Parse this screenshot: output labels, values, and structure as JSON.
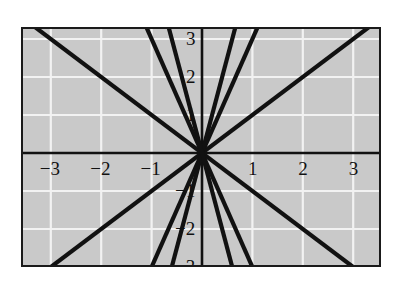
{
  "figure": {
    "title": "",
    "background_color": "#ffffff",
    "plot_background_color": "#c9c9c9",
    "frame_color": "#1a1a1a",
    "gridline_color": "#f2f2f2",
    "axis_color": "#111111",
    "line_color": "#111111"
  },
  "axes": {
    "x_tick_labels": [
      "−3",
      "−2",
      "−1",
      "1",
      "2",
      "3"
    ],
    "x_tick_values": [
      -3,
      -2,
      -1,
      1,
      2,
      3
    ],
    "y_tick_labels": [
      "3",
      "2",
      "1",
      "−1",
      "−2",
      "−3"
    ],
    "y_tick_values": [
      3,
      2,
      1,
      -1,
      -2,
      -3
    ]
  },
  "chart_data": {
    "type": "line",
    "title": "",
    "xlabel": "",
    "ylabel": "",
    "xlim": [
      -3.6,
      3.6
    ],
    "ylim": [
      -3.4,
      3.4
    ],
    "grid": true,
    "legend": "none",
    "x_ticks": [
      -3,
      -2,
      -1,
      1,
      2,
      3
    ],
    "y_ticks": [
      -3,
      -2,
      -1,
      1,
      2,
      3
    ],
    "series": [
      {
        "name": "y = 1x",
        "slope": 1,
        "intercept": 0,
        "x": [
          -3.45,
          3.45
        ],
        "y": [
          -3.45,
          3.45
        ]
      },
      {
        "name": "y = 3x",
        "slope": 3,
        "intercept": 0,
        "x": [
          -1.1,
          1.1
        ],
        "y": [
          -3.3,
          3.3
        ]
      },
      {
        "name": "y = 5x",
        "slope": 5,
        "intercept": 0,
        "x": [
          -0.66,
          0.66
        ],
        "y": [
          -3.3,
          3.3
        ]
      },
      {
        "name": "y = -1x",
        "slope": -1,
        "intercept": 0,
        "x": [
          -3.45,
          3.45
        ],
        "y": [
          3.45,
          -3.45
        ]
      },
      {
        "name": "y = -3x",
        "slope": -3,
        "intercept": 0,
        "x": [
          -1.1,
          1.1
        ],
        "y": [
          3.3,
          -3.3
        ]
      },
      {
        "name": "y = -5x",
        "slope": -5,
        "intercept": 0,
        "x": [
          -0.66,
          0.66
        ],
        "y": [
          3.3,
          -3.3
        ]
      }
    ]
  }
}
